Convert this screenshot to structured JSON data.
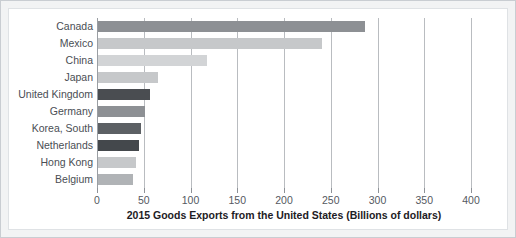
{
  "chart_data": {
    "type": "bar",
    "orientation": "horizontal",
    "title": "",
    "xlabel": "2015 Goods Exports from the United States (Billions of dollars)",
    "ylabel": "",
    "xlim": [
      0,
      400
    ],
    "xticks": [
      0,
      50,
      100,
      150,
      200,
      250,
      300,
      350,
      400
    ],
    "xtick_labels": [
      "0",
      "50",
      "100",
      "150",
      "200",
      "250",
      "300",
      "350",
      "400"
    ],
    "grid": true,
    "legend": "none",
    "categories": [
      "Canada",
      "Mexico",
      "China",
      "Japan",
      "United Kingdom",
      "Germany",
      "Korea, South",
      "Netherlands",
      "Hong Kong",
      "Belgium"
    ],
    "values": [
      287,
      241,
      118,
      65,
      57,
      51,
      47,
      45,
      42,
      39
    ],
    "bar_colors": [
      "#8d9094",
      "#c6c8ca",
      "#d2d4d6",
      "#c6c8ca",
      "#4a4d51",
      "#8d9094",
      "#5c6064",
      "#44484c",
      "#c6c8ca",
      "#b0b3b6"
    ]
  },
  "style": {
    "grid_color": "#b9bcc0",
    "axis_color": "#9a9ea3",
    "frame_color": "#c9cdd2",
    "panel_color": "#ffffff",
    "label_color": "#4a4e54"
  }
}
